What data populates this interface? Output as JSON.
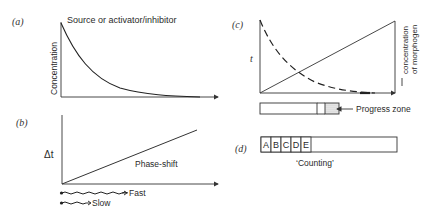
{
  "panels": {
    "a": {
      "label": "(a)",
      "title": "Source or activator/inhibitor",
      "ylabel": "Concentration"
    },
    "b": {
      "label": "(b)",
      "ylabel": "Δt",
      "line_label": "Phase-shift",
      "legend": [
        {
          "name": "fast",
          "label": "Fast"
        },
        {
          "name": "slow",
          "label": "Slow"
        }
      ]
    },
    "c": {
      "label": "(c)",
      "ylabel": "t",
      "right_label_line1": "concentration",
      "right_label_line2": "of morphogen",
      "zone_label": "Progress zone"
    },
    "d": {
      "label": "(d)",
      "cells": [
        "A",
        "B",
        "C",
        "D",
        "E"
      ],
      "caption": "‘Counting’"
    }
  }
}
